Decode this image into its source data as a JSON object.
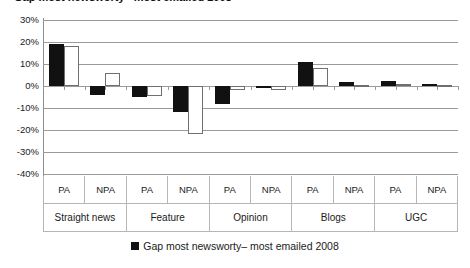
{
  "chart_data": {
    "type": "bar",
    "title": "Gap most newsworty– most emailed 2008",
    "xlabel": "",
    "ylabel": "",
    "ylim": [
      -40,
      30
    ],
    "grid": true,
    "legend_position": "bottom-center",
    "yticks": [
      "30%",
      "20%",
      "10%",
      "0%",
      "-10%",
      "-20%",
      "-30%",
      "-40%"
    ],
    "ytick_values": [
      30,
      20,
      10,
      0,
      -10,
      -20,
      -30,
      -40
    ],
    "groups": [
      "Straight news",
      "Feature",
      "Opinion",
      "Blogs",
      "UGC"
    ],
    "subcategories": [
      "PA",
      "NPA",
      "PA",
      "NPA",
      "PA",
      "NPA",
      "PA",
      "NPA",
      "PA",
      "NPA"
    ],
    "categories": [
      "Straight news PA",
      "Straight news NPA",
      "Feature PA",
      "Feature NPA",
      "Opinion PA",
      "Opinion NPA",
      "Blogs PA",
      "Blogs NPA",
      "UGC PA",
      "UGC NPA"
    ],
    "series": [
      {
        "name": "Gap most newsworty– most emailed 2008",
        "style": "filled-black",
        "color": "#111111",
        "values": [
          19,
          -4,
          -5,
          -12,
          -8,
          0,
          11,
          2,
          2.5,
          1
        ]
      },
      {
        "name": "second bar",
        "style": "outlined-white",
        "color": "#ffffff",
        "border_color": "#6f6f6f",
        "values": [
          18,
          6,
          -4.5,
          -22,
          -2,
          -2,
          8,
          0.5,
          1,
          0.5
        ]
      }
    ]
  },
  "legend": {
    "label": "Gap most newsworty– most emailed 2008",
    "swatch_color": "#111111"
  },
  "colors": {
    "dark_bar": "#111111",
    "light_bar": "#ffffff",
    "gridline": "#9a9a9a",
    "table_border": "#b6b6b6",
    "text": "#1a1a1a",
    "background": "#ffffff"
  }
}
